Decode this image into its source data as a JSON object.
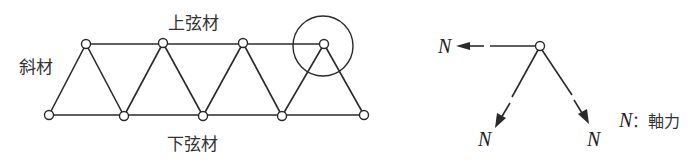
{
  "truss": {
    "labels": {
      "top_chord": "上弦材",
      "bottom_chord": "下弦材",
      "diagonal": "斜材"
    },
    "top_nodes": [
      [
        86,
        44
      ],
      [
        163,
        43
      ],
      [
        243,
        43
      ],
      [
        324,
        44
      ]
    ],
    "bottom_nodes": [
      [
        49,
        115
      ],
      [
        124,
        116
      ],
      [
        203,
        116
      ],
      [
        282,
        116
      ],
      [
        364,
        115
      ]
    ],
    "highlight_circle": {
      "cx": 323,
      "cy": 46,
      "r": 30
    }
  },
  "free_body": {
    "node": [
      540,
      46
    ],
    "force_symbol": "N",
    "forces": [
      {
        "direction": "left",
        "label": "N"
      },
      {
        "direction": "down-left",
        "label": "N"
      },
      {
        "direction": "down-right",
        "label": "N"
      }
    ],
    "legend": {
      "symbol": "N",
      "separator": "：",
      "meaning": "軸力"
    }
  },
  "colors": {
    "line": "#2a2a2a",
    "background": "#ffffff"
  }
}
